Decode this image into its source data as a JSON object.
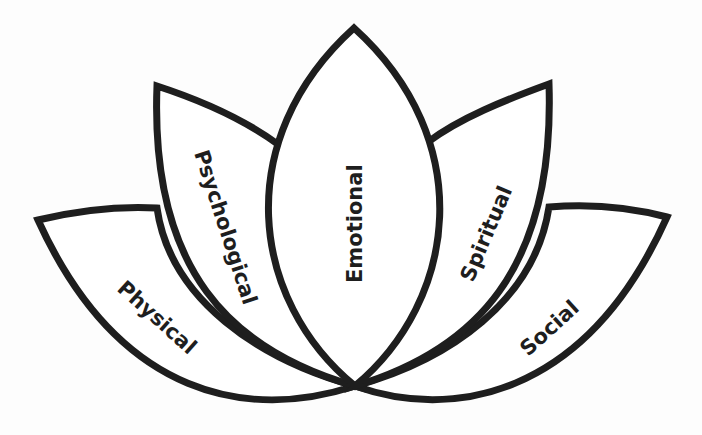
{
  "diagram": {
    "type": "lotus",
    "stroke_color": "#1e1e1e",
    "fill_color": "#ffffff",
    "background": "#fdfdfd",
    "petals": [
      {
        "id": "physical",
        "label": "Physical"
      },
      {
        "id": "psychological",
        "label": "Psychological"
      },
      {
        "id": "emotional",
        "label": "Emotional"
      },
      {
        "id": "spiritual",
        "label": "Spiritual"
      },
      {
        "id": "social",
        "label": "Social"
      }
    ]
  }
}
